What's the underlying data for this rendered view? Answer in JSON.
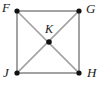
{
  "figure": {
    "type": "geometry-diagram",
    "shape": "square-with-diagonals",
    "background_color": "#ffffff",
    "line_color": "#a3a3a3",
    "point_color": "#111111",
    "label_color": "#1a1a1a",
    "width": 103,
    "height": 94,
    "vertices": [
      {
        "id": "F",
        "label": "F",
        "x": 17,
        "y": 11,
        "label_position": "top-left"
      },
      {
        "id": "G",
        "label": "G",
        "x": 79,
        "y": 11,
        "label_position": "top-right"
      },
      {
        "id": "H",
        "label": "H",
        "x": 79,
        "y": 73,
        "label_position": "bottom-right"
      },
      {
        "id": "J",
        "label": "J",
        "x": 17,
        "y": 73,
        "label_position": "bottom-left"
      },
      {
        "id": "K",
        "label": "K",
        "x": 49,
        "y": 42,
        "label_position": "above-center"
      }
    ],
    "segments": [
      {
        "from": "F",
        "to": "G",
        "kind": "side"
      },
      {
        "from": "G",
        "to": "H",
        "kind": "side"
      },
      {
        "from": "H",
        "to": "J",
        "kind": "side"
      },
      {
        "from": "J",
        "to": "F",
        "kind": "side"
      },
      {
        "from": "F",
        "to": "H",
        "kind": "diagonal"
      },
      {
        "from": "G",
        "to": "J",
        "kind": "diagonal"
      }
    ]
  }
}
